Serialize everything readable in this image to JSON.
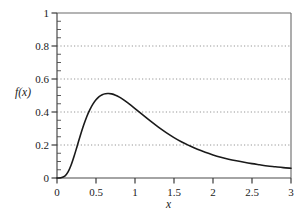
{
  "chart_data": {
    "type": "line",
    "title": "",
    "subtitle": "",
    "xlabel": "x",
    "ylabel": "f(x)",
    "xlim": [
      0,
      3
    ],
    "ylim": [
      0,
      1
    ],
    "grid": "horizontal-dotted",
    "legend": "none",
    "xticks": [
      0,
      0.5,
      1,
      1.5,
      2,
      2.5,
      3
    ],
    "xtick_labels": [
      "0",
      "0.5",
      "1",
      "1.5",
      "2",
      "2.5",
      "3"
    ],
    "yticks": [
      0,
      0.2,
      0.4,
      0.6,
      0.8,
      1
    ],
    "ytick_labels": [
      "0",
      "0.2",
      "0.4",
      "0.6",
      "0.8",
      "1"
    ],
    "x_minor_tick_step": 0.1,
    "y_minor_tick_step": 0.05,
    "gridline_values": [
      0.2,
      0.4,
      0.6,
      0.8
    ],
    "line_color": "#1a1a1a",
    "line_width": 1.6,
    "axis_color": "#5a5a5a",
    "grid_color": "#8a8a8a",
    "background_color": "#ffffff",
    "peak": {
      "x": 0.62,
      "y": 0.51
    },
    "series": [
      {
        "name": "f(x)",
        "x": [
          0.0,
          0.05,
          0.1,
          0.14,
          0.18,
          0.22,
          0.26,
          0.3,
          0.34,
          0.38,
          0.42,
          0.46,
          0.5,
          0.54,
          0.58,
          0.62,
          0.66,
          0.7,
          0.75,
          0.8,
          0.85,
          0.9,
          0.95,
          1.0,
          1.1,
          1.2,
          1.3,
          1.4,
          1.5,
          1.6,
          1.7,
          1.8,
          1.9,
          2.0,
          2.1,
          2.2,
          2.3,
          2.4,
          2.5,
          2.6,
          2.7,
          2.8,
          2.9,
          3.0
        ],
        "y": [
          0.0,
          0.001,
          0.011,
          0.035,
          0.077,
          0.133,
          0.196,
          0.259,
          0.318,
          0.37,
          0.413,
          0.448,
          0.474,
          0.493,
          0.505,
          0.511,
          0.512,
          0.51,
          0.502,
          0.49,
          0.475,
          0.458,
          0.44,
          0.421,
          0.382,
          0.344,
          0.308,
          0.275,
          0.245,
          0.218,
          0.195,
          0.174,
          0.156,
          0.14,
          0.126,
          0.114,
          0.104,
          0.095,
          0.087,
          0.08,
          0.073,
          0.068,
          0.063,
          0.059
        ]
      }
    ]
  },
  "axes": {
    "y_title_f": "f",
    "y_title_paren_open": "(",
    "y_title_var": "x",
    "y_title_paren_close": ")",
    "x_title": "x"
  },
  "ytick_labels": {
    "t0": "0",
    "t1": "0.2",
    "t2": "0.4",
    "t3": "0.6",
    "t4": "0.8",
    "t5": "1"
  },
  "xtick_labels": {
    "t0": "0",
    "t1": "0.5",
    "t2": "1",
    "t3": "1.5",
    "t4": "2",
    "t5": "2.5",
    "t6": "3"
  }
}
